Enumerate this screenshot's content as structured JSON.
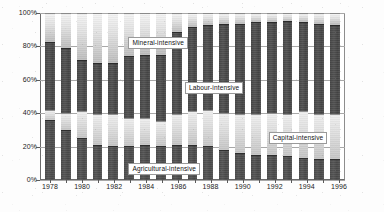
{
  "chart_data": {
    "type": "bar",
    "subtype": "100% stacked column",
    "title": "",
    "xlabel": "",
    "ylabel": "",
    "ylim": [
      0,
      100
    ],
    "ytick_labels": [
      "0%",
      "20%",
      "40%",
      "60%",
      "80%",
      "100%"
    ],
    "ytick_values": [
      0,
      20,
      40,
      60,
      80,
      100
    ],
    "grid": true,
    "legend_position": "inline-annotations",
    "categories": [
      "1978",
      "1979",
      "1980",
      "1981",
      "1982",
      "1983",
      "1984",
      "1985",
      "1986",
      "1987",
      "1988",
      "1989",
      "1990",
      "1991",
      "1992",
      "1993",
      "1994",
      "1995",
      "1996"
    ],
    "xtick_labels": [
      "1978",
      "1980",
      "1982",
      "1984",
      "1986",
      "1988",
      "1990",
      "1992",
      "1994",
      "1996"
    ],
    "series": [
      {
        "name": "Agricultural-intensive",
        "color": "#505050",
        "values": [
          36,
          30,
          25,
          21,
          20,
          20,
          21,
          20,
          21,
          21,
          20,
          18,
          16,
          15,
          15,
          14,
          13,
          12,
          12
        ]
      },
      {
        "name": "Capital-intensive",
        "color": "#dcdcdc",
        "values": [
          6,
          10,
          16,
          18,
          19,
          17,
          16,
          15,
          18,
          20,
          22,
          22,
          23,
          24,
          25,
          25,
          28,
          27,
          27
        ]
      },
      {
        "name": "Labour-intensive",
        "color": "#4c4c4c",
        "values": [
          41,
          39,
          31,
          31,
          31,
          37,
          38,
          40,
          50,
          51,
          51,
          54,
          55,
          56,
          55,
          57,
          54,
          55,
          54
        ]
      },
      {
        "name": "Mineral-intensive",
        "color": "#e6e6e6",
        "values": [
          17,
          21,
          28,
          30,
          30,
          26,
          25,
          25,
          11,
          8,
          7,
          6,
          6,
          5,
          5,
          4,
          5,
          6,
          7
        ]
      }
    ],
    "annotations": [
      {
        "text": "Mineral-intensive",
        "x_pct": 29.0,
        "y_pct": 85.5
      },
      {
        "text": "Labour-intensive",
        "x_pct": 47.5,
        "y_pct": 58.5
      },
      {
        "text": "Capital-intensive",
        "x_pct": 75.0,
        "y_pct": 28.5
      },
      {
        "text": "Agricultural-intensive",
        "x_pct": 29.0,
        "y_pct": 10.0
      }
    ]
  }
}
